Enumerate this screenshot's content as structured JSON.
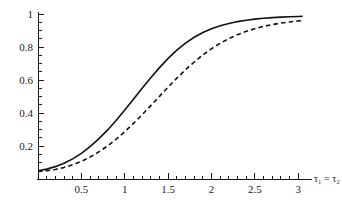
{
  "chart_data": {
    "type": "line",
    "title": "",
    "subtitle": "",
    "xlabel": "τ₁ = τ₂",
    "ylabel": "",
    "xlim": [
      0,
      3.1
    ],
    "ylim": [
      0,
      1.0
    ],
    "grid": false,
    "legend": "none",
    "x_ticks_major": [
      0.5,
      1,
      1.5,
      2,
      2.5,
      3
    ],
    "x_tick_labels": [
      "0.5",
      "1",
      "1.5",
      "2",
      "2.5",
      "3"
    ],
    "x_ticks_minor": [
      0.1,
      0.2,
      0.3,
      0.4,
      0.6,
      0.7,
      0.8,
      0.9,
      1.1,
      1.2,
      1.3,
      1.4,
      1.6,
      1.7,
      1.8,
      1.9,
      2.1,
      2.2,
      2.3,
      2.4,
      2.6,
      2.7,
      2.8,
      2.9,
      3.0
    ],
    "y_ticks_major": [
      0.2,
      0.4,
      0.6,
      0.8,
      1
    ],
    "y_tick_labels": [
      "0.2",
      "0.4",
      "0.6",
      "0.8",
      "1"
    ],
    "y_ticks_minor": [
      0.05,
      0.1,
      0.15,
      0.25,
      0.3,
      0.35,
      0.45,
      0.5,
      0.55,
      0.65,
      0.7,
      0.75,
      0.85,
      0.9,
      0.95
    ],
    "x": [
      0.0,
      0.1,
      0.2,
      0.3,
      0.4,
      0.5,
      0.6,
      0.7,
      0.8,
      0.9,
      1.0,
      1.1,
      1.2,
      1.3,
      1.4,
      1.5,
      1.6,
      1.7,
      1.8,
      1.9,
      2.0,
      2.1,
      2.2,
      2.3,
      2.4,
      2.5,
      2.6,
      2.7,
      2.8,
      2.9,
      3.0,
      3.05
    ],
    "series": [
      {
        "name": "solid-curve",
        "style": "solid",
        "color": "#111111",
        "values": [
          0.05,
          0.06,
          0.075,
          0.095,
          0.122,
          0.155,
          0.196,
          0.243,
          0.296,
          0.355,
          0.418,
          0.484,
          0.55,
          0.614,
          0.675,
          0.731,
          0.781,
          0.823,
          0.859,
          0.888,
          0.911,
          0.929,
          0.943,
          0.954,
          0.962,
          0.969,
          0.974,
          0.978,
          0.981,
          0.983,
          0.985,
          0.986
        ]
      },
      {
        "name": "dashed-curve",
        "style": "dashed",
        "color": "#111111",
        "values": [
          0.045,
          0.05,
          0.058,
          0.07,
          0.086,
          0.107,
          0.133,
          0.164,
          0.2,
          0.241,
          0.287,
          0.337,
          0.39,
          0.445,
          0.501,
          0.557,
          0.611,
          0.662,
          0.709,
          0.752,
          0.79,
          0.823,
          0.851,
          0.875,
          0.895,
          0.911,
          0.925,
          0.936,
          0.945,
          0.952,
          0.958,
          0.961
        ]
      }
    ]
  },
  "axes": {
    "x_axis_name": "tau1 equals tau2 axis",
    "y_axis_name": "probability axis"
  }
}
